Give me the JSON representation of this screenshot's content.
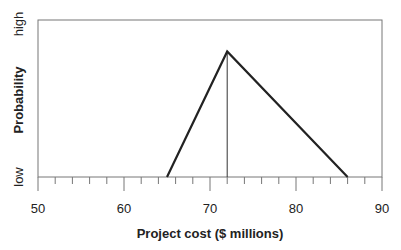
{
  "chart_data": {
    "type": "line",
    "title": "",
    "xlabel": "Project cost ($ millions)",
    "ylabel": "Probability",
    "xlim": [
      50,
      90
    ],
    "x_ticks": [
      50,
      60,
      70,
      80,
      90
    ],
    "x_minor_step": 2,
    "y_tick_labels": [
      "low",
      "high"
    ],
    "grid": false,
    "series": [
      {
        "name": "Triangular distribution",
        "x": [
          65,
          72,
          86
        ],
        "y": [
          0,
          0.8,
          0
        ]
      }
    ],
    "annotations": [
      {
        "type": "vertical-line",
        "x": 72,
        "label": "mode"
      }
    ]
  },
  "labels": {
    "xlabel": "Project cost ($ millions)",
    "ylabel": "Probability",
    "y_low": "low",
    "y_high": "high",
    "x50": "50",
    "x60": "60",
    "x70": "70",
    "x80": "80",
    "x90": "90"
  }
}
